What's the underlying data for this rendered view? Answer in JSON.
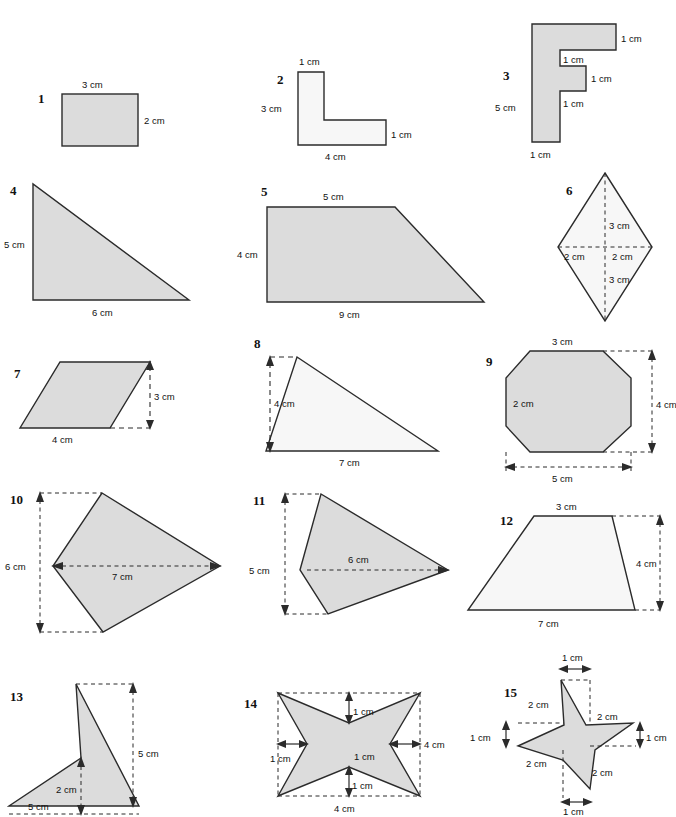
{
  "page": {
    "header_left": "",
    "header_right": "",
    "units": "cm",
    "colors": {
      "shape_fill_dark": "#dcdcdc",
      "shape_fill_light": "#f7f7f7",
      "outline": "#2b2b2b",
      "background": "#ffffff",
      "text": "#111111"
    }
  },
  "figures": [
    {
      "number": "1",
      "shape": "rectangle",
      "fill": "dark",
      "labels": {
        "top": "3 cm",
        "right": "2 cm"
      },
      "all_labels": [
        "3 cm",
        "2 cm"
      ]
    },
    {
      "number": "2",
      "shape": "L-shape",
      "fill": "light",
      "labels": {
        "top": "1 cm",
        "left": "3 cm",
        "bottom": "4 cm",
        "right": "1 cm"
      },
      "all_labels": [
        "1 cm",
        "3 cm",
        "4 cm",
        "1 cm"
      ]
    },
    {
      "number": "3",
      "shape": "F-shape",
      "fill": "dark",
      "labels": {
        "top": "3 cm",
        "upper_right": "1 cm",
        "inner_upper": "1 cm",
        "inner_right": "1 cm",
        "inner_lower": "1 cm",
        "left": "5 cm",
        "bottom": "1 cm"
      },
      "all_labels": [
        "3 cm",
        "1 cm",
        "1 cm",
        "1 cm",
        "1 cm",
        "5 cm",
        "1 cm"
      ]
    },
    {
      "number": "4",
      "shape": "right-triangle",
      "fill": "dark",
      "labels": {
        "left": "5 cm",
        "bottom": "6 cm"
      },
      "all_labels": [
        "5 cm",
        "6 cm"
      ]
    },
    {
      "number": "5",
      "shape": "trapezoid",
      "fill": "dark",
      "labels": {
        "top": "5 cm",
        "left": "4 cm",
        "bottom": "9 cm"
      },
      "all_labels": [
        "5 cm",
        "4 cm",
        "9 cm"
      ]
    },
    {
      "number": "6",
      "shape": "rhombus",
      "fill": "light",
      "labels": {
        "upper": "3 cm",
        "lower": "3 cm",
        "left": "2 cm",
        "right": "2 cm"
      },
      "all_labels": [
        "3 cm",
        "2 cm",
        "2 cm",
        "3 cm"
      ]
    },
    {
      "number": "7",
      "shape": "parallelogram",
      "fill": "dark",
      "labels": {
        "bottom": "4 cm",
        "height": "3 cm"
      },
      "all_labels": [
        "4 cm",
        "3 cm"
      ]
    },
    {
      "number": "8",
      "shape": "triangle",
      "fill": "light",
      "labels": {
        "height": "4 cm",
        "bottom": "7 cm"
      },
      "all_labels": [
        "4 cm",
        "7 cm"
      ]
    },
    {
      "number": "9",
      "shape": "octagon",
      "fill": "dark",
      "labels": {
        "top": "3 cm",
        "inner_left": "2 cm",
        "height": "4 cm",
        "width": "5 cm"
      },
      "all_labels": [
        "3 cm",
        "2 cm",
        "4 cm",
        "5 cm"
      ]
    },
    {
      "number": "10",
      "shape": "kite-quadrilateral",
      "fill": "dark",
      "labels": {
        "height": "6 cm",
        "width": "7 cm"
      },
      "all_labels": [
        "6 cm",
        "7 cm"
      ]
    },
    {
      "number": "11",
      "shape": "kite-quadrilateral",
      "fill": "dark",
      "labels": {
        "height": "5 cm",
        "width": "6 cm"
      },
      "all_labels": [
        "5 cm",
        "6 cm"
      ]
    },
    {
      "number": "12",
      "shape": "trapezoid",
      "fill": "light",
      "labels": {
        "top": "3 cm",
        "height": "4 cm",
        "bottom": "7 cm"
      },
      "all_labels": [
        "3 cm",
        "4 cm",
        "7 cm"
      ]
    },
    {
      "number": "13",
      "shape": "arrowhead-chevron",
      "fill": "dark",
      "labels": {
        "height": "5 cm",
        "notch": "2 cm",
        "width": "5 cm"
      },
      "all_labels": [
        "5 cm",
        "2 cm",
        "5 cm"
      ]
    },
    {
      "number": "14",
      "shape": "four-pointed-star",
      "fill": "dark",
      "labels": {
        "top_notch": "1 cm",
        "left_notch": "1 cm",
        "right_notch": "1 cm",
        "bottom_notch": "1 cm",
        "height": "4 cm",
        "width": "4 cm"
      },
      "all_labels": [
        "1 cm",
        "1 cm",
        "1 cm",
        "4 cm",
        "1 cm",
        "4 cm"
      ]
    },
    {
      "number": "15",
      "shape": "five-pointed-star",
      "fill": "dark",
      "labels": {
        "top": "1 cm",
        "upper_left": "2 cm",
        "upper_right": "2 cm",
        "left": "1 cm",
        "right": "1 cm",
        "lower_left": "2 cm",
        "lower_right": "2 cm",
        "bottom": "1 cm"
      },
      "all_labels": [
        "1 cm",
        "2 cm",
        "2 cm",
        "1 cm",
        "1 cm",
        "2 cm",
        "2 cm",
        "1 cm"
      ]
    }
  ]
}
